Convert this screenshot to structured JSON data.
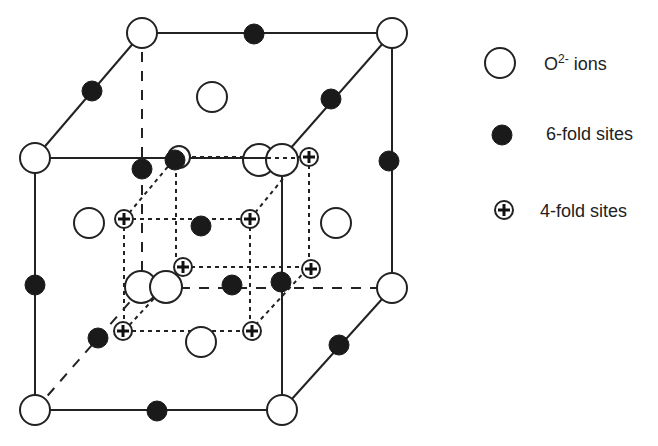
{
  "legend": {
    "o_ion": {
      "label_main": "O",
      "label_sup": "2-",
      "label_tail": " ions",
      "symbol": "open-circle"
    },
    "six_fold": {
      "label": "6-fold sites",
      "symbol": "filled-circle"
    },
    "four_fold": {
      "label": "4-fold sites",
      "symbol": "circle-plus"
    }
  },
  "colors": {
    "line": "#222222",
    "fill_dark": "#1a1a1a",
    "background": "#ffffff"
  },
  "structure": {
    "outer_cube": {
      "front_face": [
        [
          35,
          158
        ],
        [
          282,
          158
        ],
        [
          282,
          410
        ],
        [
          35,
          410
        ]
      ],
      "back_face": [
        [
          142,
          33
        ],
        [
          392,
          33
        ],
        [
          392,
          288
        ],
        [
          142,
          288
        ]
      ]
    },
    "inner_cube": {
      "front_face": [
        [
          124,
          219
        ],
        [
          250,
          219
        ],
        [
          250,
          331
        ],
        [
          124,
          331
        ]
      ],
      "back_face": [
        [
          176,
          157
        ],
        [
          309,
          157
        ],
        [
          309,
          267
        ],
        [
          176,
          267
        ]
      ]
    }
  }
}
